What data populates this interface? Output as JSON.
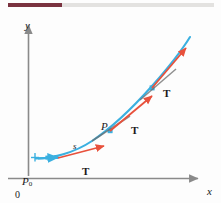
{
  "page": {
    "background_color": "#fdfdfd",
    "width": 221,
    "height": 203
  },
  "top_rule": {
    "accent_color": "#7a3340",
    "track_color": "#e3e2e0"
  },
  "figure": {
    "caption": "",
    "axes": {
      "color": "#8a8a8a",
      "y_axis_label": "y",
      "x_axis_label": "x",
      "origin_label": "0"
    },
    "curve": {
      "color": "#3bb0e0",
      "description": "smooth increasing curve"
    },
    "tangent_vectors": {
      "color": "#e8513c",
      "labels": [
        "T",
        "T",
        "T"
      ]
    },
    "points": {
      "start_label": "P",
      "start_sub": "0",
      "mid_label": "P",
      "marker_color": "#3bb0e0"
    },
    "arc_length_label": "s"
  },
  "labels": {
    "y": "y",
    "x": "x",
    "zero": "0",
    "p_zero": "P",
    "p_zero_sub": "0",
    "s": "s",
    "p": "P",
    "t1": "T",
    "t2": "T",
    "t3": "T"
  }
}
